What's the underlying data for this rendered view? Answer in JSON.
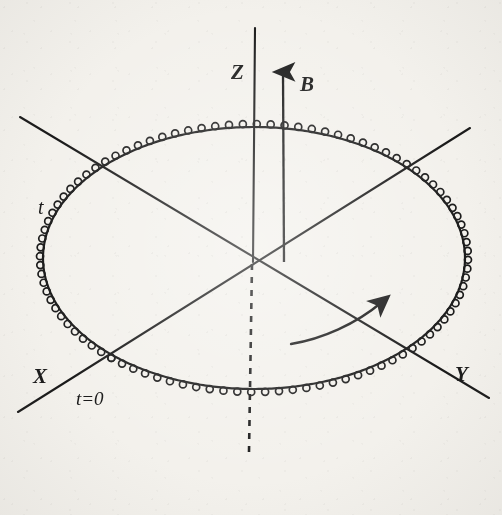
{
  "figure": {
    "kind": "spin-precession-diagram",
    "background_color": "#f3f1ec",
    "ink_color": "#1a1a1a",
    "ghost_color": "#b9b4ab",
    "axes": {
      "z": {
        "label": "Z",
        "label_x": 231,
        "label_y": 60,
        "solid_from_y": 28,
        "solid_to_y": 262,
        "dashed_to_y": 452,
        "x": 255
      },
      "x": {
        "label": "X",
        "label_x": 33,
        "label_y": 364
      },
      "y": {
        "label": "Y",
        "label_x": 455,
        "label_y": 362
      }
    },
    "field_arrow": {
      "label": "B",
      "label_x": 300,
      "label_y": 72,
      "x": 283,
      "tip_y": 66,
      "tail_y": 262
    },
    "annotations": [
      {
        "name": "t-label",
        "text": "t",
        "x": 38,
        "y": 196
      },
      {
        "name": "t-zero-label",
        "text": "t=0",
        "x": 76,
        "y": 388
      }
    ],
    "rotation_arrow": {
      "name": "rotation-direction-arrow",
      "direction": "counterclockwise-in-plane"
    },
    "spiral": {
      "center_x": 254,
      "center_y": 258,
      "radius_x": 211,
      "radius_y": 131,
      "loop_count": 96,
      "start_angle_deg": 132,
      "end_angle_deg": 492
    }
  },
  "bleed_through_text": {
    "note": "faint mirrored text from the reverse side of the scanned page",
    "lines": [
      {
        "text": "0",
        "x": 214,
        "y": 2,
        "size": 17,
        "flip": true
      },
      {
        "text": "= w₀w₀",
        "x": 252,
        "y": 2,
        "size": 16,
        "flip": true
      },
      {
        "text": "(ω₀H₀",
        "x": 14,
        "y": 2,
        "size": 17,
        "flip": true
      },
      {
        "text": "0",
        "x": 172,
        "y": 24,
        "size": 17,
        "flip": true
      },
      {
        "text": "0",
        "x": 300,
        "y": 26,
        "size": 17,
        "flip": true
      },
      {
        "text": "0",
        "x": 398,
        "y": 24,
        "size": 17,
        "flip": true
      },
      {
        "text": "ω₀H₀ = i IΩ₀ IIα² α",
        "x": 148,
        "y": 78,
        "size": 17,
        "flip": true
      },
      {
        "text": "rst 2c of ou",
        "x": 4,
        "y": 78,
        "size": 17,
        "flip": true
      },
      {
        "text": "can be inserted",
        "x": 96,
        "y": 104,
        "size": 17,
        "flip": true
      },
      {
        "text": "eutons",
        "x": 6,
        "y": 104,
        "size": 17,
        "flip": true
      },
      {
        "text": "t stated (6.",
        "x": 4,
        "y": 130,
        "size": 17,
        "flip": true
      },
      {
        "text": "ψ II torψ",
        "x": 154,
        "y": 196,
        "size": 17,
        "flip": true
      },
      {
        "text": "Ε (γ , 0 ,",
        "x": 62,
        "y": 196,
        "size": 17,
        "flip": true
      },
      {
        "text": "1 = R o",
        "x": 368,
        "y": 196,
        "size": 17,
        "flip": true
      },
      {
        "text": "(ω₀Hβ)",
        "x": 160,
        "y": 228,
        "size": 17,
        "flip": true
      },
      {
        "text": "en ln (α.θ).",
        "x": 4,
        "y": 310,
        "size": 17,
        "flip": true
      },
      {
        "text": "The spin is precessing th",
        "x": 102,
        "y": 310,
        "size": 17,
        "flip": true
      },
      {
        "text": "e city of the c",
        "x": 4,
        "y": 338,
        "size": 17,
        "flip": true
      },
      {
        "text": "motion is represe",
        "x": 118,
        "y": 338,
        "size": 17,
        "flip": true
      },
      {
        "text": "at first order.  We represent it in Figure 2",
        "x": 4,
        "y": 366,
        "size": 17,
        "flip": true
      },
      {
        "text": "time interval as the one depicted in E",
        "x": 4,
        "y": 394,
        "size": 17,
        "flip": true
      },
      {
        "text": "tion θ = 10° and φ = 90°  where we",
        "x": 4,
        "y": 422,
        "size": 17,
        "flip": true
      }
    ]
  }
}
